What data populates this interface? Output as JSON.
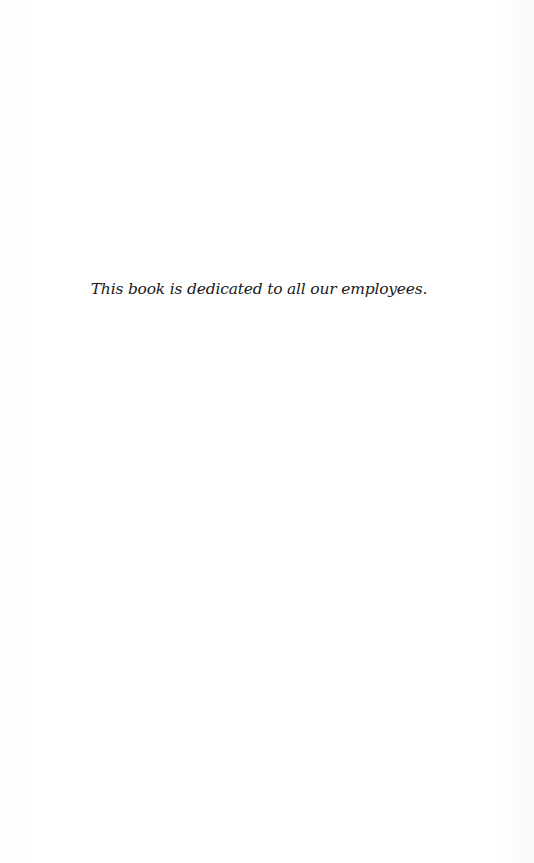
{
  "page": {
    "dedication": "This book is dedicated to all our employees."
  }
}
